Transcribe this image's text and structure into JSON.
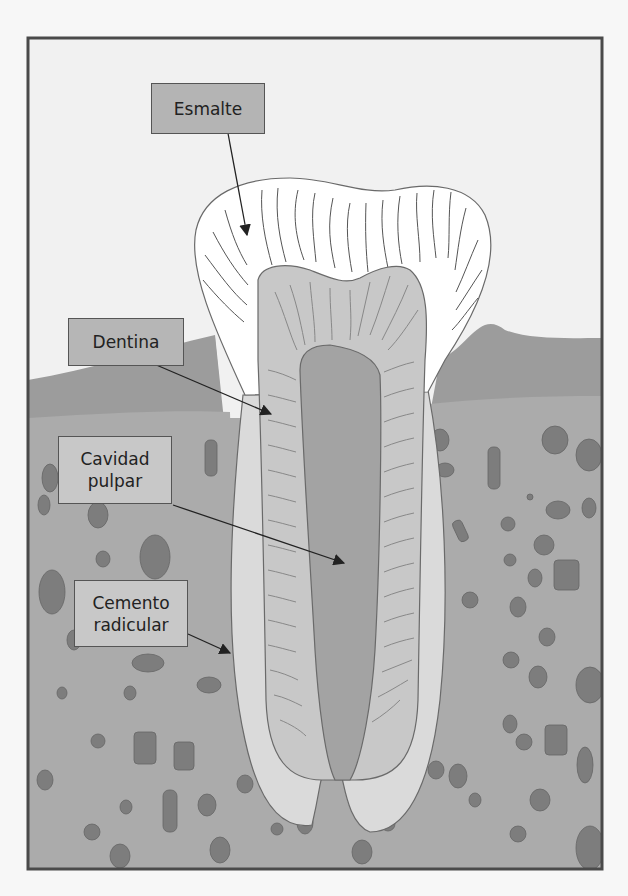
{
  "diagram": {
    "colors": {
      "background": "#f7f7f7",
      "frame": "#4a4a4a",
      "soft_tissue_light": "#f1f1f1",
      "gum": "#9a9a9a",
      "bone": "#a9a9a9",
      "enamel": "#ffffff",
      "dentin": "#c9c9c9",
      "pulp": "#a3a3a3",
      "cementum": "#dcdcdc",
      "particle": "#7a7a7a",
      "label_fill_dark": "#b4b4b4",
      "label_fill_light": "#c8c8c8",
      "arrow": "#222222"
    },
    "labels": [
      {
        "id": "esmalte",
        "lines": [
          "Esmalte"
        ]
      },
      {
        "id": "dentina",
        "lines": [
          "Dentina"
        ]
      },
      {
        "id": "cavidad-pulpar",
        "lines": [
          "Cavidad",
          "pulpar"
        ]
      },
      {
        "id": "cemento-radicular",
        "lines": [
          "Cemento",
          "radicular"
        ]
      }
    ]
  }
}
